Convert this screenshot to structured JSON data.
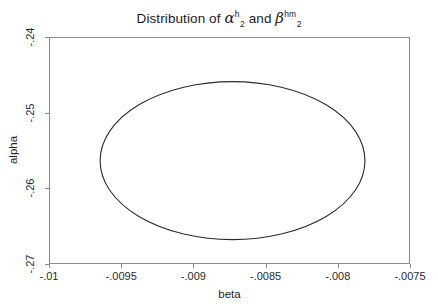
{
  "chart_data": {
    "type": "line",
    "title_parts": {
      "prefix": "Distribution of ",
      "first_symbol": "α",
      "first_sup": "h",
      "first_sub": "2",
      "conjunction": " and ",
      "second_symbol": "β",
      "second_sup": "hm",
      "second_sub": "2"
    },
    "xlabel": "beta",
    "ylabel": "alpha",
    "xticks": [
      -0.01,
      -0.0095,
      -0.009,
      -0.0085,
      -0.008,
      -0.0075
    ],
    "xtick_labels": [
      "-.01",
      "-.0095",
      "-.009",
      "-.0085",
      "-.008",
      "-.0075"
    ],
    "yticks": [
      -0.24,
      -0.25,
      -0.26,
      -0.27
    ],
    "ytick_labels": [
      "-.24",
      "-.25",
      "-.26",
      "-.27"
    ],
    "xlim": [
      -0.01,
      -0.0075
    ],
    "ylim": [
      -0.27,
      -0.24
    ],
    "grid": false,
    "legend": false,
    "series": [
      {
        "name": "confidence ellipse",
        "shape": "ellipse",
        "center": [
          -0.008729,
          -0.25634
        ],
        "semi_axis_x": 0.000917,
        "semi_axis_y": 0.010436,
        "x_range": [
          -0.009646,
          -0.007812
        ],
        "y_range": [
          -0.266776,
          -0.245904
        ],
        "stroke": "#2b2b2b",
        "fill": "none"
      }
    ]
  },
  "style": {
    "background": "#ffffff",
    "frame_color": "#8c8c8c",
    "text_color": "#1c1c1c",
    "curve_color": "#2b2b2b"
  }
}
